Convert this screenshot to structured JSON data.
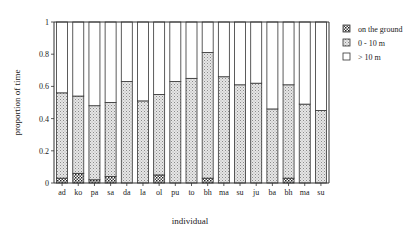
{
  "chart_data": {
    "type": "bar",
    "stacked": true,
    "title": "",
    "xlabel": "individual",
    "ylabel": "proportion of time",
    "ylim": [
      0,
      1
    ],
    "yticks": [
      "0",
      "0.2",
      "0.4",
      "0.6",
      "0.8",
      "1"
    ],
    "grid": false,
    "legend_position": "right",
    "categories": [
      "ad",
      "ko",
      "pa",
      "sa",
      "da",
      "la",
      "ol",
      "pu",
      "to",
      "bh",
      "ma",
      "su",
      "ju",
      "ba",
      "bh",
      "ma",
      "su"
    ],
    "series": [
      {
        "name": "on the ground",
        "pattern": "dark-speckle",
        "values": [
          0.03,
          0.06,
          0.02,
          0.04,
          0,
          0,
          0.05,
          0,
          0,
          0.03,
          0,
          0,
          0,
          0,
          0.03,
          0,
          0
        ]
      },
      {
        "name": "0 - 10 m",
        "pattern": "light-stipple",
        "values": [
          0.53,
          0.48,
          0.46,
          0.46,
          0.63,
          0.51,
          0.5,
          0.63,
          0.65,
          0.78,
          0.66,
          0.61,
          0.62,
          0.46,
          0.58,
          0.49,
          0.45
        ]
      },
      {
        "name": "> 10 m",
        "pattern": "white",
        "values": [
          0.44,
          0.46,
          0.52,
          0.5,
          0.37,
          0.49,
          0.45,
          0.37,
          0.35,
          0.19,
          0.34,
          0.39,
          0.38,
          0.54,
          0.39,
          0.51,
          0.55
        ]
      }
    ]
  },
  "legend": {
    "items": [
      {
        "label": "on the ground"
      },
      {
        "label": "0 - 10 m"
      },
      {
        "label": "> 10 m"
      }
    ]
  },
  "axes": {
    "xlabel": "individual",
    "ylabel": "proportion of time"
  }
}
